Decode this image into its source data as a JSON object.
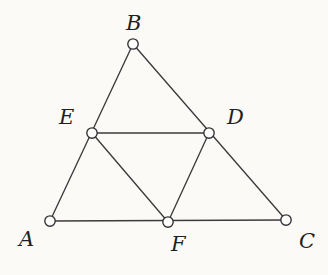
{
  "figure": {
    "name": "medial-triangle",
    "background_color": "#fbfaf7",
    "line_color": "#3b3b3e",
    "vertex_fill_color": "#fdfdfb",
    "vertex_stroke_color": "#2f2f33",
    "label_color": "#1f1f22",
    "vertex_radius": 5.2,
    "line_width": 1.35
  },
  "vertices": [
    {
      "id": "A",
      "label": "A",
      "x": 50,
      "y": 221,
      "label_x": 19,
      "label_y": 229
    },
    {
      "id": "B",
      "label": "B",
      "x": 133,
      "y": 44,
      "label_x": 126,
      "label_y": 13
    },
    {
      "id": "C",
      "label": "C",
      "x": 286,
      "y": 220,
      "label_x": 299,
      "label_y": 231
    },
    {
      "id": "D",
      "label": "D",
      "x": 209,
      "y": 133,
      "label_x": 227,
      "label_y": 107
    },
    {
      "id": "E",
      "label": "E",
      "x": 92,
      "y": 133,
      "label_x": 59,
      "label_y": 107
    },
    {
      "id": "F",
      "label": "F",
      "x": 168,
      "y": 222,
      "label_x": 171,
      "label_y": 234
    }
  ],
  "edges": [
    {
      "id": "A-B",
      "from": "A",
      "to": "B"
    },
    {
      "id": "B-C",
      "from": "B",
      "to": "C"
    },
    {
      "id": "A-C",
      "from": "A",
      "to": "C"
    },
    {
      "id": "E-D",
      "from": "E",
      "to": "D"
    },
    {
      "id": "E-F",
      "from": "E",
      "to": "F"
    },
    {
      "id": "D-F",
      "from": "D",
      "to": "F"
    }
  ]
}
